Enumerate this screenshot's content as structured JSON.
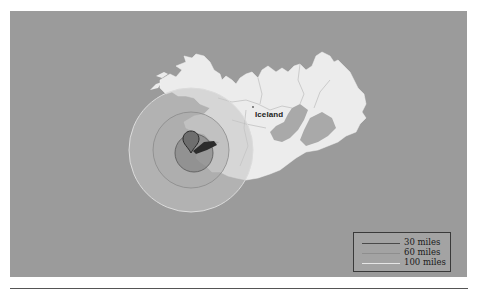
{
  "map": {
    "background_color": "#9b9b9b",
    "land_color": "#ececec",
    "country_label": "Iceland",
    "marker": {
      "icon": "map-pin-icon",
      "color": "#5a5a5a"
    },
    "radius_circles": [
      {
        "label": "30 miles",
        "radius_px": 19,
        "stroke": "#555555",
        "fill": "#888888"
      },
      {
        "label": "60 miles",
        "radius_px": 38,
        "stroke": "#8a8a8a",
        "fill": "#b0b0b0"
      },
      {
        "label": "100 miles",
        "radius_px": 62,
        "stroke": "#d8d8d8",
        "fill": "#c6c6c6"
      }
    ]
  },
  "legend": {
    "items": [
      {
        "label": "30 miles",
        "color": "#4a4a4a"
      },
      {
        "label": "60 miles",
        "color": "#8e8e8e"
      },
      {
        "label": "100 miles",
        "color": "#e6e6e6"
      }
    ]
  }
}
